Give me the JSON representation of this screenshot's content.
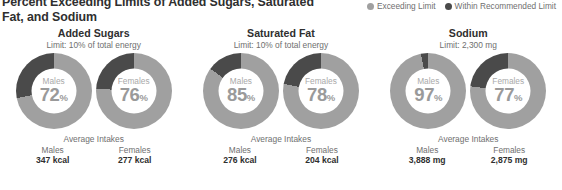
{
  "title": "Percent Exceeding Limits of Added Sugars, Saturated Fat, and Sodium",
  "legend": {
    "items": [
      {
        "label": "Exceeding Limit",
        "color": "#a0a0a0",
        "icon": "circle-icon"
      },
      {
        "label": "Within Recommended Limit",
        "color": "#4a4a4a",
        "icon": "circle-icon"
      }
    ]
  },
  "averages_heading": "Average Intakes",
  "colors": {
    "exceeding": "#a0a0a0",
    "within": "#4a4a4a",
    "title_text": "#2f2f2f",
    "muted_text": "#6f6f6f",
    "donut_value_text": "#9a9a9a"
  },
  "groups": [
    {
      "name": "Added Sugars",
      "limit": "Limit: 10% of total energy",
      "donuts": [
        {
          "label": "Males",
          "value": 72,
          "value_text": "72",
          "pct_symbol": "%"
        },
        {
          "label": "Females",
          "value": 76,
          "value_text": "76",
          "pct_symbol": "%"
        }
      ],
      "averages": [
        {
          "label": "Males",
          "amount": "347 kcal"
        },
        {
          "label": "Females",
          "amount": "277 kcal"
        }
      ]
    },
    {
      "name": "Saturated Fat",
      "limit": "Limit: 10% of total energy",
      "donuts": [
        {
          "label": "Males",
          "value": 85,
          "value_text": "85",
          "pct_symbol": "%"
        },
        {
          "label": "Females",
          "value": 78,
          "value_text": "78",
          "pct_symbol": "%"
        }
      ],
      "averages": [
        {
          "label": "Males",
          "amount": "276 kcal"
        },
        {
          "label": "Females",
          "amount": "204 kcal"
        }
      ]
    },
    {
      "name": "Sodium",
      "limit": "Limit: 2,300 mg",
      "donuts": [
        {
          "label": "Males",
          "value": 97,
          "value_text": "97",
          "pct_symbol": "%"
        },
        {
          "label": "Females",
          "value": 77,
          "value_text": "77",
          "pct_symbol": "%"
        }
      ],
      "averages": [
        {
          "label": "Males",
          "amount": "3,888 mg"
        },
        {
          "label": "Females",
          "amount": "2,875 mg"
        }
      ]
    }
  ],
  "chart_data": {
    "type": "pie",
    "title": "Percent Exceeding Limits of Added Sugars, Saturated Fat, and Sodium",
    "legend_position": "top-right",
    "series": [
      {
        "name": "Exceeding Limit",
        "color": "#a0a0a0"
      },
      {
        "name": "Within Recommended Limit",
        "color": "#4a4a4a"
      }
    ],
    "categories": [
      "Added Sugars - Males",
      "Added Sugars - Females",
      "Saturated Fat - Males",
      "Saturated Fat - Females",
      "Sodium - Males",
      "Sodium - Females"
    ],
    "values_exceeding": [
      72,
      76,
      85,
      78,
      97,
      77
    ],
    "values_within": [
      28,
      24,
      15,
      22,
      3,
      23
    ],
    "units": "percent",
    "annotations": [
      "Added Sugars limit: 10% of total energy",
      "Saturated Fat limit: 10% of total energy",
      "Sodium limit: 2,300 mg",
      "Average Intakes - Added Sugars: Males 347 kcal, Females 277 kcal",
      "Average Intakes - Saturated Fat: Males 276 kcal, Females 204 kcal",
      "Average Intakes - Sodium: Males 3,888 mg, Females 2,875 mg"
    ]
  }
}
